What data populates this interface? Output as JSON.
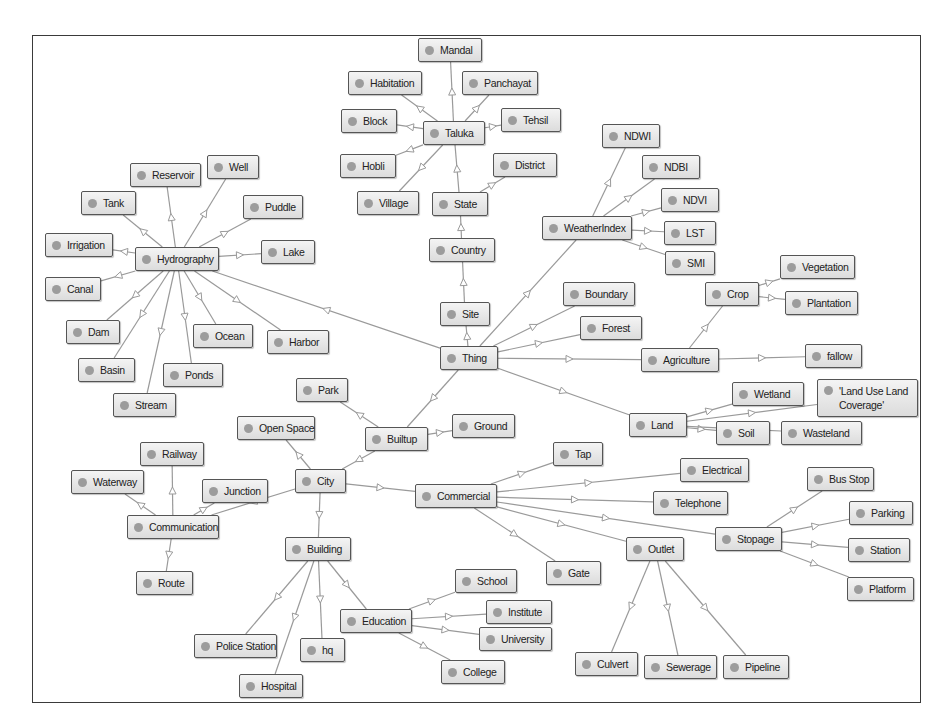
{
  "diagram": {
    "colors": {
      "edge": "#9a9a9a",
      "node_border": "#555555",
      "node_fill_top": "#f4f4f4",
      "node_fill_bottom": "#dcdcdc",
      "dot": "#9c9c9c",
      "frame": "#3a3a3a"
    },
    "nodes": [
      {
        "id": "thing",
        "label": "Thing",
        "x": 440,
        "y": 346,
        "w": 58
      },
      {
        "id": "site",
        "label": "Site",
        "x": 440,
        "y": 302,
        "w": 50
      },
      {
        "id": "country",
        "label": "Country",
        "x": 429,
        "y": 238,
        "w": 66
      },
      {
        "id": "state",
        "label": "State",
        "x": 432,
        "y": 192,
        "w": 56
      },
      {
        "id": "district",
        "label": "District",
        "x": 493,
        "y": 153,
        "w": 64
      },
      {
        "id": "taluka",
        "label": "Taluka",
        "x": 423,
        "y": 121,
        "w": 62
      },
      {
        "id": "mandal",
        "label": "Mandal",
        "x": 418,
        "y": 38,
        "w": 64
      },
      {
        "id": "habitation",
        "label": "Habitation",
        "x": 348,
        "y": 71,
        "w": 74
      },
      {
        "id": "panchayat",
        "label": "Panchayat",
        "x": 462,
        "y": 71,
        "w": 76
      },
      {
        "id": "block",
        "label": "Block",
        "x": 341,
        "y": 109,
        "w": 56
      },
      {
        "id": "tehsil",
        "label": "Tehsil",
        "x": 501,
        "y": 108,
        "w": 60
      },
      {
        "id": "hobli",
        "label": "Hobli",
        "x": 340,
        "y": 154,
        "w": 56
      },
      {
        "id": "village",
        "label": "Village",
        "x": 357,
        "y": 191,
        "w": 62
      },
      {
        "id": "weatherindex",
        "label": "WeatherIndex",
        "x": 542,
        "y": 216,
        "w": 90
      },
      {
        "id": "ndwi",
        "label": "NDWI",
        "x": 602,
        "y": 124,
        "w": 58
      },
      {
        "id": "ndbi",
        "label": "NDBI",
        "x": 642,
        "y": 155,
        "w": 58
      },
      {
        "id": "ndvi",
        "label": "NDVI",
        "x": 661,
        "y": 188,
        "w": 58
      },
      {
        "id": "lst",
        "label": "LST",
        "x": 664,
        "y": 221,
        "w": 52
      },
      {
        "id": "smi",
        "label": "SMI",
        "x": 665,
        "y": 251,
        "w": 50
      },
      {
        "id": "boundary",
        "label": "Boundary",
        "x": 563,
        "y": 282,
        "w": 72
      },
      {
        "id": "forest",
        "label": "Forest",
        "x": 580,
        "y": 316,
        "w": 62
      },
      {
        "id": "agriculture",
        "label": "Agriculture",
        "x": 641,
        "y": 348,
        "w": 78
      },
      {
        "id": "crop",
        "label": "Crop",
        "x": 705,
        "y": 282,
        "w": 54
      },
      {
        "id": "vegetation",
        "label": "Vegetation",
        "x": 780,
        "y": 255,
        "w": 75
      },
      {
        "id": "plantation",
        "label": "Plantation",
        "x": 785,
        "y": 291,
        "w": 73
      },
      {
        "id": "fallow",
        "label": "fallow",
        "x": 805,
        "y": 344,
        "w": 57
      },
      {
        "id": "land",
        "label": "Land",
        "x": 629,
        "y": 413,
        "w": 58
      },
      {
        "id": "wetland",
        "label": "Wetland",
        "x": 732,
        "y": 382,
        "w": 72
      },
      {
        "id": "landuse",
        "label": "'Land Use Land Coverage'",
        "x": 817,
        "y": 379,
        "w": 101,
        "tall": true
      },
      {
        "id": "soil",
        "label": "Soil",
        "x": 716,
        "y": 421,
        "w": 54
      },
      {
        "id": "wasteland",
        "label": "Wasteland",
        "x": 781,
        "y": 421,
        "w": 81
      },
      {
        "id": "hydrography",
        "label": "Hydrography",
        "x": 135,
        "y": 247,
        "w": 84
      },
      {
        "id": "reservoir",
        "label": "Reservoir",
        "x": 130,
        "y": 163,
        "w": 71
      },
      {
        "id": "well",
        "label": "Well",
        "x": 207,
        "y": 155,
        "w": 52
      },
      {
        "id": "tank",
        "label": "Tank",
        "x": 81,
        "y": 191,
        "w": 55
      },
      {
        "id": "puddle",
        "label": "Puddle",
        "x": 243,
        "y": 195,
        "w": 60
      },
      {
        "id": "irrigation",
        "label": "Irrigation",
        "x": 45,
        "y": 233,
        "w": 68
      },
      {
        "id": "lake",
        "label": "Lake",
        "x": 261,
        "y": 240,
        "w": 54
      },
      {
        "id": "canal",
        "label": "Canal",
        "x": 45,
        "y": 277,
        "w": 56
      },
      {
        "id": "dam",
        "label": "Dam",
        "x": 66,
        "y": 320,
        "w": 54
      },
      {
        "id": "ocean",
        "label": "Ocean",
        "x": 193,
        "y": 324,
        "w": 60
      },
      {
        "id": "harbor",
        "label": "Harbor",
        "x": 267,
        "y": 330,
        "w": 62
      },
      {
        "id": "basin",
        "label": "Basin",
        "x": 78,
        "y": 358,
        "w": 57
      },
      {
        "id": "ponds",
        "label": "Ponds",
        "x": 163,
        "y": 363,
        "w": 60
      },
      {
        "id": "stream",
        "label": "Stream",
        "x": 113,
        "y": 393,
        "w": 63
      },
      {
        "id": "park",
        "label": "Park",
        "x": 296,
        "y": 378,
        "w": 52
      },
      {
        "id": "openspace",
        "label": "Open Space",
        "x": 237,
        "y": 416,
        "w": 78
      },
      {
        "id": "builtup",
        "label": "Builtup",
        "x": 365,
        "y": 427,
        "w": 63
      },
      {
        "id": "ground",
        "label": "Ground",
        "x": 452,
        "y": 414,
        "w": 63
      },
      {
        "id": "city",
        "label": "City",
        "x": 295,
        "y": 469,
        "w": 51
      },
      {
        "id": "commercial",
        "label": "Commercial",
        "x": 415,
        "y": 484,
        "w": 82
      },
      {
        "id": "railway",
        "label": "Railway",
        "x": 140,
        "y": 442,
        "w": 64
      },
      {
        "id": "waterway",
        "label": "Waterway",
        "x": 71,
        "y": 470,
        "w": 73
      },
      {
        "id": "junction",
        "label": "Junction",
        "x": 202,
        "y": 479,
        "w": 66
      },
      {
        "id": "communication",
        "label": "Communication",
        "x": 127,
        "y": 515,
        "w": 92
      },
      {
        "id": "route",
        "label": "Route",
        "x": 136,
        "y": 571,
        "w": 57
      },
      {
        "id": "building",
        "label": "Building",
        "x": 285,
        "y": 537,
        "w": 66
      },
      {
        "id": "tap",
        "label": "Tap",
        "x": 553,
        "y": 442,
        "w": 50
      },
      {
        "id": "electrical",
        "label": "Electrical",
        "x": 680,
        "y": 458,
        "w": 69
      },
      {
        "id": "telephone",
        "label": "Telephone",
        "x": 653,
        "y": 491,
        "w": 75
      },
      {
        "id": "stopage",
        "label": "Stopage",
        "x": 715,
        "y": 527,
        "w": 67
      },
      {
        "id": "busstop",
        "label": "Bus Stop",
        "x": 807,
        "y": 467,
        "w": 67
      },
      {
        "id": "parking",
        "label": "Parking",
        "x": 849,
        "y": 501,
        "w": 64
      },
      {
        "id": "station",
        "label": "Station",
        "x": 848,
        "y": 538,
        "w": 62
      },
      {
        "id": "platform",
        "label": "Platform",
        "x": 847,
        "y": 577,
        "w": 67
      },
      {
        "id": "outlet",
        "label": "Outlet",
        "x": 626,
        "y": 537,
        "w": 58
      },
      {
        "id": "gate",
        "label": "Gate",
        "x": 546,
        "y": 561,
        "w": 55
      },
      {
        "id": "culvert",
        "label": "Culvert",
        "x": 575,
        "y": 652,
        "w": 63
      },
      {
        "id": "sewerage",
        "label": "Sewerage",
        "x": 644,
        "y": 655,
        "w": 73
      },
      {
        "id": "pipeline",
        "label": "Pipeline",
        "x": 723,
        "y": 655,
        "w": 66
      },
      {
        "id": "education",
        "label": "Education",
        "x": 340,
        "y": 609,
        "w": 72
      },
      {
        "id": "school",
        "label": "School",
        "x": 455,
        "y": 569,
        "w": 62
      },
      {
        "id": "institute",
        "label": "Institute",
        "x": 486,
        "y": 600,
        "w": 66
      },
      {
        "id": "university",
        "label": "University",
        "x": 479,
        "y": 627,
        "w": 73
      },
      {
        "id": "college",
        "label": "College",
        "x": 441,
        "y": 660,
        "w": 64
      },
      {
        "id": "policestation",
        "label": "Police Station",
        "x": 194,
        "y": 634,
        "w": 83
      },
      {
        "id": "hq",
        "label": "hq",
        "x": 300,
        "y": 638,
        "w": 45
      },
      {
        "id": "hospital",
        "label": "Hospital",
        "x": 239,
        "y": 674,
        "w": 64
      }
    ],
    "edges": [
      [
        "thing",
        "site"
      ],
      [
        "site",
        "country"
      ],
      [
        "country",
        "state"
      ],
      [
        "state",
        "taluka"
      ],
      [
        "state",
        "district"
      ],
      [
        "taluka",
        "mandal"
      ],
      [
        "taluka",
        "habitation"
      ],
      [
        "taluka",
        "panchayat"
      ],
      [
        "taluka",
        "block"
      ],
      [
        "taluka",
        "tehsil"
      ],
      [
        "taluka",
        "hobli"
      ],
      [
        "taluka",
        "village"
      ],
      [
        "thing",
        "weatherindex"
      ],
      [
        "weatherindex",
        "ndwi"
      ],
      [
        "weatherindex",
        "ndbi"
      ],
      [
        "weatherindex",
        "ndvi"
      ],
      [
        "weatherindex",
        "lst"
      ],
      [
        "weatherindex",
        "smi"
      ],
      [
        "thing",
        "boundary"
      ],
      [
        "thing",
        "forest"
      ],
      [
        "thing",
        "agriculture"
      ],
      [
        "agriculture",
        "crop"
      ],
      [
        "crop",
        "vegetation"
      ],
      [
        "crop",
        "plantation"
      ],
      [
        "agriculture",
        "fallow"
      ],
      [
        "thing",
        "land"
      ],
      [
        "land",
        "wetland"
      ],
      [
        "land",
        "landuse"
      ],
      [
        "land",
        "soil"
      ],
      [
        "land",
        "wasteland"
      ],
      [
        "thing",
        "hydrography"
      ],
      [
        "hydrography",
        "reservoir"
      ],
      [
        "hydrography",
        "well"
      ],
      [
        "hydrography",
        "tank"
      ],
      [
        "hydrography",
        "puddle"
      ],
      [
        "hydrography",
        "irrigation"
      ],
      [
        "hydrography",
        "lake"
      ],
      [
        "hydrography",
        "canal"
      ],
      [
        "hydrography",
        "dam"
      ],
      [
        "hydrography",
        "ocean"
      ],
      [
        "hydrography",
        "harbor"
      ],
      [
        "hydrography",
        "basin"
      ],
      [
        "hydrography",
        "ponds"
      ],
      [
        "hydrography",
        "stream"
      ],
      [
        "thing",
        "builtup"
      ],
      [
        "builtup",
        "park"
      ],
      [
        "builtup",
        "ground"
      ],
      [
        "builtup",
        "city"
      ],
      [
        "city",
        "openspace"
      ],
      [
        "city",
        "communication"
      ],
      [
        "communication",
        "railway"
      ],
      [
        "communication",
        "waterway"
      ],
      [
        "communication",
        "junction"
      ],
      [
        "communication",
        "route"
      ],
      [
        "city",
        "commercial"
      ],
      [
        "commercial",
        "tap"
      ],
      [
        "commercial",
        "electrical"
      ],
      [
        "commercial",
        "telephone"
      ],
      [
        "commercial",
        "stopage"
      ],
      [
        "commercial",
        "outlet"
      ],
      [
        "commercial",
        "gate"
      ],
      [
        "stopage",
        "busstop"
      ],
      [
        "stopage",
        "parking"
      ],
      [
        "stopage",
        "station"
      ],
      [
        "stopage",
        "platform"
      ],
      [
        "outlet",
        "culvert"
      ],
      [
        "outlet",
        "sewerage"
      ],
      [
        "outlet",
        "pipeline"
      ],
      [
        "city",
        "building"
      ],
      [
        "building",
        "education"
      ],
      [
        "building",
        "policestation"
      ],
      [
        "building",
        "hq"
      ],
      [
        "building",
        "hospital"
      ],
      [
        "education",
        "school"
      ],
      [
        "education",
        "institute"
      ],
      [
        "education",
        "university"
      ],
      [
        "education",
        "college"
      ]
    ]
  }
}
